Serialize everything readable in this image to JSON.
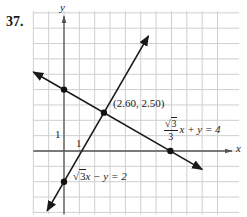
{
  "problem_number": "37.",
  "chart_data": {
    "type": "line",
    "title": "",
    "xlabel": "x",
    "ylabel": "y",
    "grid": true,
    "xlim": [
      -2,
      11
    ],
    "ylim": [
      -4,
      9
    ],
    "tick_labels": {
      "x_unit": "1",
      "y_unit": "1"
    },
    "series": [
      {
        "name": "sqrt(3)/3 x + y = 4",
        "equation": "√3/3 x + y = 4",
        "slope": -0.577,
        "intercept": 4,
        "x": [
          -2,
          9
        ],
        "y": [
          5.15,
          -1.2
        ],
        "marked_points": [
          [
            0,
            4
          ],
          [
            6.93,
            0
          ]
        ]
      },
      {
        "name": "sqrt(3) x - y = 2",
        "equation": "√3x − y = 2",
        "slope": 1.732,
        "intercept": -2,
        "x": [
          -1.1,
          5.5
        ],
        "y": [
          -3.9,
          7.5
        ],
        "marked_points": [
          [
            0,
            -2
          ]
        ]
      }
    ],
    "annotations": [
      {
        "text": "(2.60, 2.50)",
        "x": 2.6,
        "y": 2.5,
        "type": "intersection"
      }
    ]
  },
  "labels": {
    "intersection": "(2.60, 2.50)",
    "eq1_num": "3",
    "eq1_den": "3",
    "eq1_rest": "x + y = 4",
    "eq2_root": "3",
    "eq2_rest": "x − y = 2",
    "x_axis": "x",
    "y_axis": "y",
    "x_unit": "1",
    "y_unit": "1"
  }
}
